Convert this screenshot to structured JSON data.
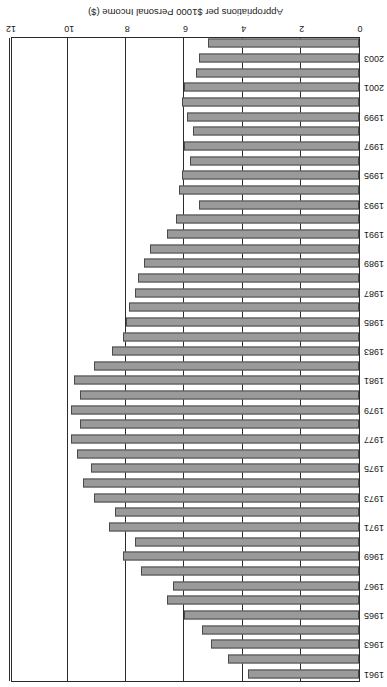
{
  "chart_data": {
    "type": "bar",
    "orientation": "horizontal",
    "title": "",
    "subtitle": "",
    "xlabel": "Appropriations per $1000 Personal Income ($)",
    "ylabel": "",
    "xlim": [
      0,
      12
    ],
    "xticks": [
      0,
      2,
      4,
      6,
      8,
      10,
      12
    ],
    "xtick_labels": [
      "0",
      "2",
      "4",
      "6",
      "8",
      "10",
      "12"
    ],
    "grid": true,
    "legend": false,
    "legend_position": "none",
    "bar_color": "#9a9a9a",
    "bar_edge_color": "#4a4a4a",
    "axis_color": "#2b2b2b",
    "rotated_180": true,
    "categories": [
      "1961",
      "1962",
      "1963",
      "1964",
      "1965",
      "1966",
      "1967",
      "1968",
      "1969",
      "1970",
      "1971",
      "1972",
      "1973",
      "1974",
      "1975",
      "1976",
      "1977",
      "1978",
      "1979",
      "1980",
      "1981",
      "1982",
      "1983",
      "1984",
      "1985",
      "1986",
      "1987",
      "1988",
      "1989",
      "1990",
      "1991",
      "1992",
      "1993",
      "1994",
      "1995",
      "1996",
      "1997",
      "1998",
      "1999",
      "2000",
      "2001",
      "2002",
      "2003",
      "2004"
    ],
    "visible_tick_labels": [
      "1961",
      "1963",
      "1965",
      "1967",
      "1969",
      "1971",
      "1973",
      "1975",
      "1977",
      "1979",
      "1981",
      "1983",
      "1985",
      "1987",
      "1989",
      "1991",
      "1993",
      "1995",
      "1997",
      "1999",
      "2001",
      "2003"
    ],
    "values": [
      3.8,
      4.5,
      5.1,
      5.4,
      6.0,
      6.6,
      6.4,
      7.5,
      8.1,
      7.7,
      8.6,
      8.4,
      9.1,
      9.5,
      9.2,
      9.7,
      9.9,
      9.6,
      9.9,
      9.6,
      9.8,
      9.1,
      8.5,
      8.1,
      8.0,
      7.9,
      7.7,
      7.6,
      7.4,
      7.2,
      6.6,
      6.3,
      5.5,
      6.2,
      6.1,
      5.8,
      6.0,
      5.7,
      5.9,
      6.1,
      6.0,
      5.6,
      5.5,
      5.2
    ]
  }
}
